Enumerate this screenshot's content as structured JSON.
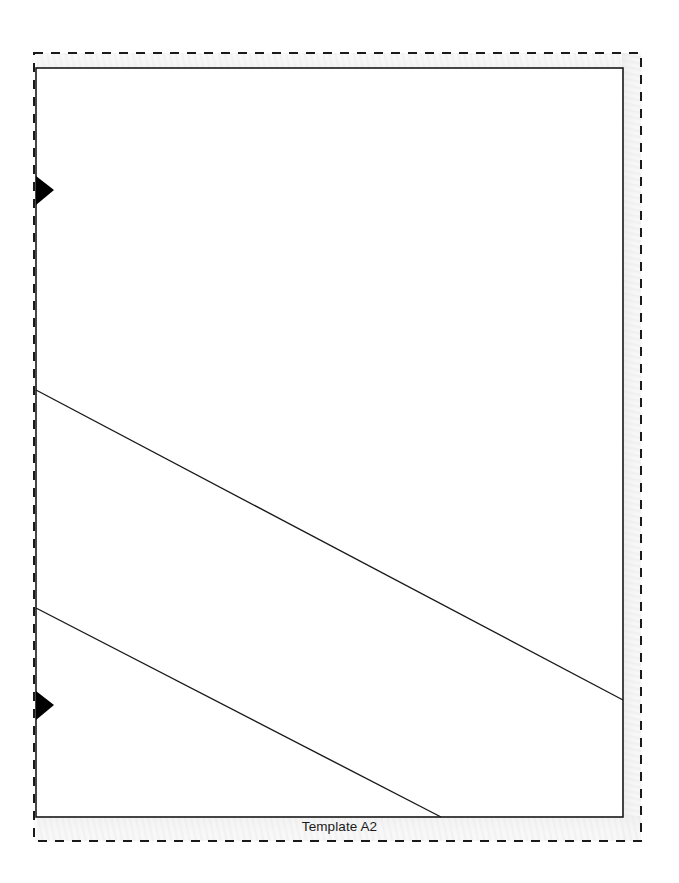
{
  "document": {
    "title": "Template A2",
    "background_color": "#ffffff",
    "width": 679,
    "height": 883
  },
  "caption": {
    "text": "Template A2",
    "color": "#1a1a1a",
    "align": "center"
  },
  "page_border": {
    "style": "dashed",
    "color": "#1a1a1a",
    "stroke_width": 2,
    "dash_length": 9,
    "dash_gap": 8,
    "x": 34,
    "y": 53,
    "width": 607,
    "height": 788
  },
  "content_frame": {
    "style": "solid",
    "color": "#1a1a1a",
    "stroke_width": 1.6,
    "x": 36,
    "y": 68,
    "width": 587,
    "height": 749
  },
  "margin_shade": {
    "color": "#f2f2f2",
    "pattern": "fine-diagonal-stripes",
    "opacity": 0.55
  },
  "markers": [
    {
      "name": "left-marker-top",
      "shape": "triangle-right",
      "fill": "#000000",
      "tip_x": 54,
      "tip_y": 190,
      "base_x": 36,
      "base_top_y": 176,
      "base_bottom_y": 205
    },
    {
      "name": "left-marker-bottom",
      "shape": "triangle-right",
      "fill": "#000000",
      "tip_x": 54,
      "tip_y": 705,
      "base_x": 36,
      "base_top_y": 691,
      "base_bottom_y": 720
    }
  ],
  "fold_lines": [
    {
      "name": "fold-line-upper",
      "x1": 36,
      "y1": 390,
      "x2": 623,
      "y2": 700,
      "color": "#1a1a1a",
      "stroke_width": 1.4
    },
    {
      "name": "fold-line-lower",
      "x1": 36,
      "y1": 608,
      "x2": 441,
      "y2": 817,
      "color": "#1a1a1a",
      "stroke_width": 1.4
    }
  ]
}
